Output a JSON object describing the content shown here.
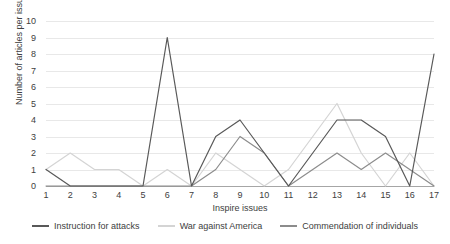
{
  "chart_data": {
    "type": "line",
    "title": "",
    "xlabel": "Inspire issues",
    "ylabel": "Number of articles per issue",
    "x": [
      1,
      2,
      3,
      4,
      5,
      6,
      7,
      8,
      9,
      10,
      11,
      12,
      13,
      14,
      15,
      16,
      17
    ],
    "xticklabels": [
      "1",
      "2",
      "3",
      "4",
      "5",
      "6",
      "7",
      "8",
      "9",
      "10",
      "11",
      "12",
      "13",
      "14",
      "15",
      "16",
      "17"
    ],
    "yticklabels": [
      "0",
      "1",
      "2",
      "3",
      "4",
      "5",
      "6",
      "7",
      "8",
      "9",
      "10"
    ],
    "ylim": [
      0,
      10
    ],
    "xlim": [
      1,
      17
    ],
    "grid": true,
    "legend_position": "bottom",
    "series": [
      {
        "name": "Instruction for attacks",
        "color": "#595959",
        "values": [
          1,
          0,
          0,
          0,
          0,
          9,
          0,
          3,
          4,
          2,
          0,
          2,
          4,
          4,
          3,
          0,
          8
        ]
      },
      {
        "name": "War against America",
        "color": "#d4d4d4",
        "values": [
          1,
          2,
          1,
          1,
          0,
          1,
          0,
          2,
          1,
          0,
          1,
          3,
          5,
          2,
          0,
          2,
          0
        ]
      },
      {
        "name": "Commendation of individuals",
        "color": "#8c8c8c",
        "values": [
          0,
          0,
          0,
          0,
          0,
          0,
          0,
          1,
          3,
          2,
          0,
          1,
          2,
          1,
          2,
          1,
          0
        ]
      }
    ]
  },
  "axes": {
    "y_title": "Number of articles per issue",
    "x_title": "Inspire issues"
  },
  "legend": {
    "items": [
      {
        "label": "Instruction for attacks",
        "color": "#595959"
      },
      {
        "label": "War against America",
        "color": "#d4d4d4"
      },
      {
        "label": "Commendation of individuals",
        "color": "#8c8c8c"
      }
    ]
  }
}
